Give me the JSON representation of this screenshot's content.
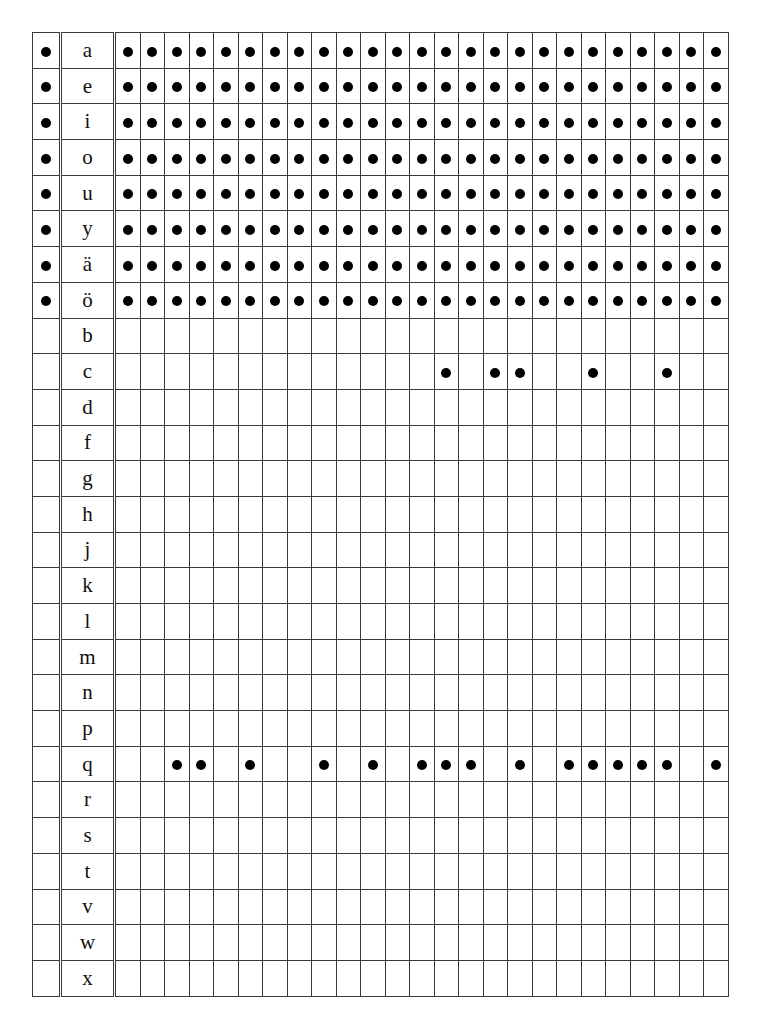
{
  "table": {
    "num_data_columns": 25,
    "dot_color": "#000000",
    "rows": [
      {
        "letter": "a",
        "marked": true,
        "dots": [
          1,
          2,
          3,
          4,
          5,
          6,
          7,
          8,
          9,
          10,
          11,
          12,
          13,
          14,
          15,
          16,
          17,
          18,
          19,
          20,
          21,
          22,
          23,
          24,
          25
        ]
      },
      {
        "letter": "e",
        "marked": true,
        "dots": [
          1,
          2,
          3,
          4,
          5,
          6,
          7,
          8,
          9,
          10,
          11,
          12,
          13,
          14,
          15,
          16,
          17,
          18,
          19,
          20,
          21,
          22,
          23,
          24,
          25
        ]
      },
      {
        "letter": "i",
        "marked": true,
        "dots": [
          1,
          2,
          3,
          4,
          5,
          6,
          7,
          8,
          9,
          10,
          11,
          12,
          13,
          14,
          15,
          16,
          17,
          18,
          19,
          20,
          21,
          22,
          23,
          24,
          25
        ]
      },
      {
        "letter": "o",
        "marked": true,
        "dots": [
          1,
          2,
          3,
          4,
          5,
          6,
          7,
          8,
          9,
          10,
          11,
          12,
          13,
          14,
          15,
          16,
          17,
          18,
          19,
          20,
          21,
          22,
          23,
          24,
          25
        ]
      },
      {
        "letter": "u",
        "marked": true,
        "dots": [
          1,
          2,
          3,
          4,
          5,
          6,
          7,
          8,
          9,
          10,
          11,
          12,
          13,
          14,
          15,
          16,
          17,
          18,
          19,
          20,
          21,
          22,
          23,
          24,
          25
        ]
      },
      {
        "letter": "y",
        "marked": true,
        "dots": [
          1,
          2,
          3,
          4,
          5,
          6,
          7,
          8,
          9,
          10,
          11,
          12,
          13,
          14,
          15,
          16,
          17,
          18,
          19,
          20,
          21,
          22,
          23,
          24,
          25
        ]
      },
      {
        "letter": "ä",
        "marked": true,
        "dots": [
          1,
          2,
          3,
          4,
          5,
          6,
          7,
          8,
          9,
          10,
          11,
          12,
          13,
          14,
          15,
          16,
          17,
          18,
          19,
          20,
          21,
          22,
          23,
          24,
          25
        ]
      },
      {
        "letter": "ö",
        "marked": true,
        "dots": [
          1,
          2,
          3,
          4,
          5,
          6,
          7,
          8,
          9,
          10,
          11,
          12,
          13,
          14,
          15,
          16,
          17,
          18,
          19,
          20,
          21,
          22,
          23,
          24,
          25
        ]
      },
      {
        "letter": "b",
        "marked": false,
        "dots": []
      },
      {
        "letter": "c",
        "marked": false,
        "dots": [
          14,
          16,
          17,
          20,
          23
        ]
      },
      {
        "letter": "d",
        "marked": false,
        "dots": []
      },
      {
        "letter": "f",
        "marked": false,
        "dots": []
      },
      {
        "letter": "g",
        "marked": false,
        "dots": []
      },
      {
        "letter": "h",
        "marked": false,
        "dots": []
      },
      {
        "letter": "j",
        "marked": false,
        "dots": []
      },
      {
        "letter": "k",
        "marked": false,
        "dots": []
      },
      {
        "letter": "l",
        "marked": false,
        "dots": []
      },
      {
        "letter": "m",
        "marked": false,
        "dots": []
      },
      {
        "letter": "n",
        "marked": false,
        "dots": []
      },
      {
        "letter": "p",
        "marked": false,
        "dots": []
      },
      {
        "letter": "q",
        "marked": false,
        "dots": [
          3,
          4,
          6,
          9,
          11,
          13,
          14,
          15,
          17,
          19,
          20,
          21,
          22,
          23,
          25
        ]
      },
      {
        "letter": "r",
        "marked": false,
        "dots": []
      },
      {
        "letter": "s",
        "marked": false,
        "dots": []
      },
      {
        "letter": "t",
        "marked": false,
        "dots": []
      },
      {
        "letter": "v",
        "marked": false,
        "dots": []
      },
      {
        "letter": "w",
        "marked": false,
        "dots": []
      },
      {
        "letter": "x",
        "marked": false,
        "dots": []
      }
    ]
  }
}
